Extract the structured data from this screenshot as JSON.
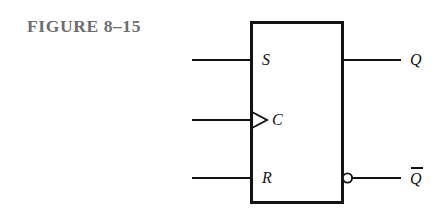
{
  "figure": {
    "caption": "FIGURE 8–15",
    "caption_color": "#6e6e70",
    "line_color": "#131313",
    "background": "#ffffff",
    "kind": "logic-symbol",
    "device": "edge-triggered S-R flip-flop"
  },
  "diagram": {
    "body": {
      "label": "flip-flop-body",
      "x": 251,
      "y": 22,
      "width": 91,
      "height": 180,
      "stroke_width": 3
    },
    "inputs": [
      {
        "id": "s",
        "label": "S",
        "wire_y": 60,
        "wire_x1": 192,
        "wire_x2": 251,
        "clocked": false
      },
      {
        "id": "c",
        "label": "C",
        "wire_y": 120,
        "wire_x1": 192,
        "wire_x2": 251,
        "clocked": true
      },
      {
        "id": "r",
        "label": "R",
        "wire_y": 178,
        "wire_x1": 192,
        "wire_x2": 251,
        "clocked": false
      }
    ],
    "outputs": [
      {
        "id": "q",
        "label": "Q",
        "overbar": false,
        "wire_y": 60,
        "wire_x1": 342,
        "wire_x2": 401,
        "inverted": false
      },
      {
        "id": "qbar",
        "label": "Q",
        "overbar": true,
        "wire_y": 178,
        "wire_x1": 353,
        "wire_x2": 401,
        "inverted": true
      }
    ],
    "dynamic_indicator": {
      "name": "clock-triangle",
      "apex_x": 267,
      "base_x": 251,
      "center_y": 120,
      "half_height": 8
    },
    "inversion_bubble": {
      "name": "qbar-inversion-bubble",
      "cx": 347.5,
      "cy": 178,
      "r": 4.6
    }
  }
}
